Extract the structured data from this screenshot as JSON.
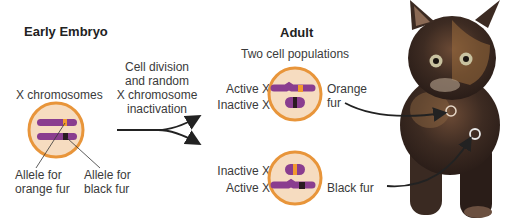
{
  "embryo": {
    "heading": "Early Embryo",
    "cell_label": "X chromosomes",
    "allele_orange_line1": "Allele for",
    "allele_orange_line2": "orange fur",
    "allele_black_line1": "Allele for",
    "allele_black_line2": "black fur"
  },
  "process": {
    "line1": "Cell division",
    "line2": "and random",
    "line3": "X chromosome",
    "line4": "inactivation"
  },
  "adult": {
    "heading": "Adult",
    "subheading": "Two cell populations",
    "cell_top": {
      "label_active": "Active X",
      "label_inactive": "Inactive X",
      "result_line1": "Orange",
      "result_line2": "fur"
    },
    "cell_bottom": {
      "label_inactive": "Inactive X",
      "label_active": "Active X",
      "result": "Black fur"
    }
  },
  "colors": {
    "cell_fill": "#f6dcc0",
    "cell_border": "#e8953a",
    "chromosome": "#8a3d8f",
    "orange_allele": "#f29a2e",
    "black_allele": "#2a1a22",
    "arrow": "#222222"
  }
}
